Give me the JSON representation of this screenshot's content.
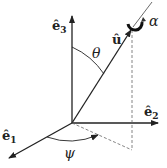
{
  "diagram": {
    "axes": [
      {
        "id": "e3",
        "label": "ê",
        "subscript": "3"
      },
      {
        "id": "e2",
        "label": "ê",
        "subscript": "2"
      },
      {
        "id": "e1",
        "label": "ê",
        "subscript": "1"
      }
    ],
    "vector": {
      "label": "û"
    },
    "angles": {
      "theta": "θ",
      "psi": "ψ",
      "alpha": "α"
    },
    "colors": {
      "ink": "#222222",
      "dashed": "#666666"
    }
  }
}
